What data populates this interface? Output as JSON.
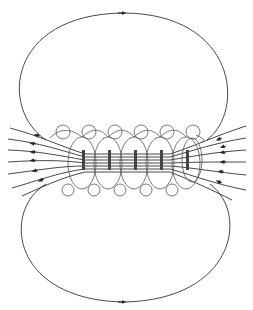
{
  "diagram": {
    "turns": 6,
    "colors": {
      "line": "#333333",
      "coil": "#555555",
      "background": "#ffffff"
    },
    "outer_loops": [
      {
        "name": "top-loop",
        "direction": "clockwise",
        "arrow_at": "top-center pointing right"
      },
      {
        "name": "bottom-loop",
        "direction": "counterclockwise",
        "arrow_at": "bottom-center pointing right"
      }
    ],
    "interior_field_direction": "right-to-left"
  }
}
